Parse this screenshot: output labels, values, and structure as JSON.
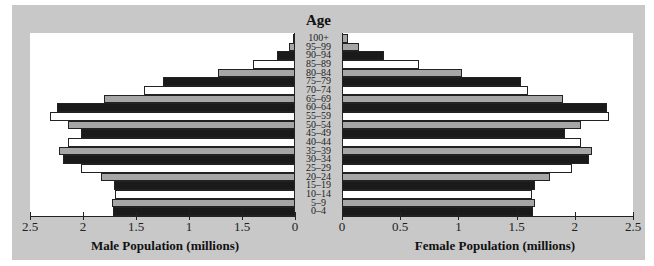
{
  "chart_data": {
    "type": "bar",
    "subtype": "population-pyramid",
    "title": "",
    "center_label": "Age",
    "categories": [
      "100+",
      "95–99",
      "90–94",
      "85–89",
      "80–84",
      "75–79",
      "70–74",
      "65–69",
      "60–64",
      "55–59",
      "50–54",
      "45–49",
      "40–44",
      "35–39",
      "30–34",
      "25–29",
      "20–24",
      "15–19",
      "10–14",
      "5–9",
      "0–4"
    ],
    "series": [
      {
        "name": "Male Population (millions)",
        "side": "left",
        "values": [
          0.02,
          0.06,
          0.17,
          0.4,
          0.73,
          1.25,
          1.42,
          1.8,
          2.25,
          2.31,
          2.14,
          2.02,
          2.14,
          2.23,
          2.19,
          2.02,
          1.83,
          1.71,
          1.7,
          1.73,
          1.72
        ]
      },
      {
        "name": "Female Population (millions)",
        "side": "right",
        "values": [
          0.05,
          0.15,
          0.36,
          0.66,
          1.03,
          1.54,
          1.6,
          1.9,
          2.28,
          2.29,
          2.05,
          1.92,
          2.05,
          2.15,
          2.12,
          1.98,
          1.79,
          1.66,
          1.63,
          1.66,
          1.64
        ]
      }
    ],
    "bar_colors": [
      "gray",
      "gray",
      "black",
      "white",
      "gray",
      "black",
      "white",
      "gray",
      "black",
      "white",
      "gray",
      "black",
      "white",
      "gray",
      "black",
      "white",
      "gray",
      "black",
      "white",
      "gray",
      "black"
    ],
    "left_axis": {
      "label": "Male Population (millions)",
      "ticks": [
        2.5,
        2,
        1.5,
        1,
        0.5,
        0
      ],
      "tick_labels": [
        "2.5",
        "2",
        "1.5",
        "1",
        "1.5",
        "0"
      ],
      "range": [
        2.5,
        0
      ]
    },
    "right_axis": {
      "label": "Female Population (millions)",
      "ticks": [
        0,
        0.5,
        1,
        1.5,
        2,
        2.5
      ],
      "tick_labels": [
        "0",
        "0.5",
        "1",
        "1.5",
        "2",
        "2.5"
      ],
      "range": [
        0,
        2.5
      ]
    },
    "grid": false,
    "legend": "none",
    "colors": {
      "black": "#1a1a1a",
      "gray": "#a6a6a6",
      "white": "#ffffff",
      "frame": "#c8c8c8"
    }
  }
}
